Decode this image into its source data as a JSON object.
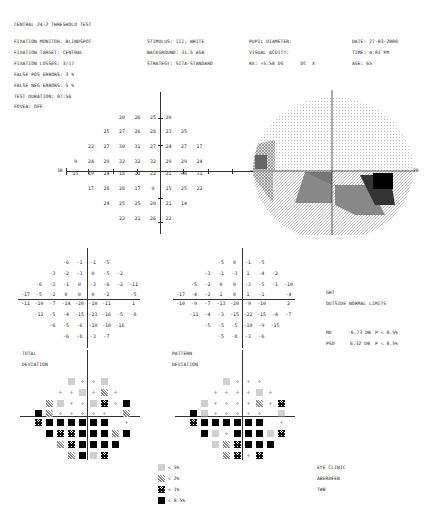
{
  "header": {
    "test_name": "CENTRAL 24-2 THRESHOLD TEST",
    "left": [
      {
        "label": "FIXATION MONITOR:",
        "value": "BLINDSPOT"
      },
      {
        "label": "FIXATION TARGET:",
        "value": "CENTRAL"
      },
      {
        "label": "FIXATION LOSSES:",
        "value": "3/17"
      },
      {
        "label": "FALSE POS ERRORS:",
        "value": "3 %"
      },
      {
        "label": "FALSE NEG ERRORS:",
        "value": "5 %"
      },
      {
        "label": "TEST DURATION:",
        "value": "07:56"
      }
    ],
    "fovea": "FOVEA: OFF",
    "middle": [
      {
        "label": "STIMULUS:",
        "value": "III, WHITE"
      },
      {
        "label": "BACKGROUND:",
        "value": "31.5 ASB"
      },
      {
        "label": "STRATEGY:",
        "value": "SITA-STANDARD"
      }
    ],
    "pupil": [
      {
        "label": "PUPIL DIAMETER:",
        "value": ""
      },
      {
        "label": "VISUAL ACUITY:",
        "value": ""
      },
      {
        "label": "RX:",
        "value": "+5.50 DS",
        "extra": "DC  X"
      }
    ],
    "right": [
      {
        "label": "DATE:",
        "value": "27-03-2000"
      },
      {
        "label": "TIME:",
        "value": "4:01 PM"
      },
      {
        "label": "AGE:",
        "value": "65"
      }
    ]
  },
  "threshold_plot": {
    "axis_label_left": "30",
    "axis_label_right": "30",
    "rows": [
      [
        null,
        null,
        null,
        "20",
        "26",
        "25",
        "20",
        null,
        null,
        null
      ],
      [
        null,
        null,
        "25",
        "27",
        "26",
        "28",
        "23",
        "25",
        null,
        null
      ],
      [
        null,
        "22",
        "27",
        "30",
        "31",
        "27",
        "24",
        "27",
        "17",
        null
      ],
      [
        "9",
        "24",
        "29",
        "32",
        "32",
        "32",
        "29",
        "29",
        "24",
        null
      ],
      [
        "15",
        "19",
        "24",
        "18",
        "12",
        "22",
        "21",
        "<0",
        "31",
        null
      ],
      [
        null,
        "17",
        "28",
        "28",
        "17",
        "9",
        "15",
        "25",
        "22",
        null
      ],
      [
        null,
        null,
        "24",
        "25",
        "25",
        "20",
        "21",
        "14",
        null,
        null
      ],
      [
        null,
        null,
        null,
        "22",
        "21",
        "26",
        "22",
        null,
        null,
        null
      ]
    ]
  },
  "total_deviation": {
    "label_line1": "TOTAL",
    "label_line2": "DEVIATION",
    "rows": [
      [
        null,
        null,
        null,
        "-6",
        "-1",
        "-1",
        "-5",
        null,
        null
      ],
      [
        null,
        null,
        "-3",
        "-2",
        "-3",
        "0",
        "-5",
        "-2",
        null
      ],
      [
        null,
        "-6",
        "-3",
        "-1",
        "0",
        "-3",
        "-6",
        "-2",
        "-11"
      ],
      [
        "-17",
        "-5",
        "-2",
        "0",
        "0",
        "0",
        "-2",
        null,
        "-5"
      ],
      [
        "-11",
        "-10",
        "-7",
        "-14",
        "-20",
        "-10",
        "-11",
        null,
        "1"
      ],
      [
        null,
        "-12",
        "-5",
        "-4",
        "-15",
        "-23",
        "-16",
        "-5",
        "-8"
      ],
      [
        null,
        null,
        "-6",
        "-5",
        "-6",
        "-10",
        "-10",
        "-16",
        null
      ],
      [
        null,
        null,
        null,
        "-6",
        "-8",
        "-3",
        "-7",
        null,
        null
      ]
    ],
    "symbols": [
      [
        null,
        null,
        null,
        1,
        0,
        0,
        1,
        null,
        null
      ],
      [
        null,
        null,
        0,
        0,
        1,
        0,
        2,
        0,
        null
      ],
      [
        null,
        2,
        1,
        0,
        0,
        1,
        3,
        0,
        4
      ],
      [
        4,
        2,
        0,
        0,
        0,
        0,
        0,
        null,
        2
      ],
      [
        3,
        4,
        4,
        4,
        4,
        4,
        4,
        null,
        0
      ],
      [
        null,
        4,
        3,
        3,
        4,
        4,
        4,
        2,
        4
      ],
      [
        null,
        null,
        2,
        3,
        4,
        4,
        4,
        4,
        null
      ],
      [
        null,
        null,
        null,
        2,
        4,
        1,
        3,
        null,
        null
      ]
    ]
  },
  "pattern_deviation": {
    "label_line1": "PATTERN",
    "label_line2": "DEVIATION",
    "rows": [
      [
        null,
        null,
        null,
        "-5",
        "0",
        "-1",
        "-5",
        null,
        null
      ],
      [
        null,
        null,
        "-3",
        "-1",
        "-3",
        "1",
        "-4",
        "-2",
        null
      ],
      [
        null,
        "-5",
        "-2",
        "0",
        "0",
        "-3",
        "-5",
        "-1",
        "-10"
      ],
      [
        "-17",
        "-4",
        "-2",
        "1",
        "0",
        "1",
        "-1",
        null,
        "-4"
      ],
      [
        "-10",
        "-9",
        "-7",
        "-13",
        "-20",
        "-9",
        "-10",
        null,
        "2"
      ],
      [
        null,
        "-11",
        "-4",
        "-3",
        "-15",
        "-22",
        "-15",
        "-4",
        "-7"
      ],
      [
        null,
        null,
        "-5",
        "-5",
        "-5",
        "-10",
        "-9",
        "-15",
        null
      ],
      [
        null,
        null,
        null,
        "-5",
        "-8",
        "-3",
        "-6",
        null,
        null
      ]
    ],
    "symbols": [
      [
        null,
        null,
        null,
        1,
        0,
        0,
        0,
        null,
        null
      ],
      [
        null,
        null,
        0,
        0,
        0,
        0,
        1,
        0,
        null
      ],
      [
        null,
        1,
        0,
        0,
        0,
        0,
        2,
        0,
        3
      ],
      [
        4,
        1,
        0,
        0,
        0,
        0,
        0,
        null,
        1
      ],
      [
        3,
        4,
        4,
        4,
        4,
        4,
        4,
        null,
        0
      ],
      [
        null,
        4,
        1,
        0,
        4,
        4,
        4,
        1,
        3
      ],
      [
        null,
        null,
        1,
        2,
        3,
        4,
        4,
        4,
        null
      ],
      [
        null,
        null,
        null,
        2,
        3,
        0,
        3,
        null,
        null
      ]
    ]
  },
  "indices": {
    "ght_label": "GHT",
    "ght_value": "OUTSIDE NORMAL LIMITS",
    "md": {
      "label": "MD",
      "value": "-6.73 DB",
      "p": "P < 0.5%"
    },
    "psd": {
      "label": "PSD",
      "value": "6.32 DB",
      "p": "P < 0.5%"
    }
  },
  "legend": [
    {
      "symbol": "p5",
      "text": "< 5%"
    },
    {
      "symbol": "p2",
      "text": "< 2%"
    },
    {
      "symbol": "p1",
      "text": "< 1%"
    },
    {
      "symbol": "p05",
      "text": "< 0.5%"
    }
  ],
  "footer": {
    "line1": "EYE CLINIC",
    "line2": "ABERDEEN",
    "line3": "TWB"
  },
  "grayscale": {
    "axis_label": "30"
  }
}
